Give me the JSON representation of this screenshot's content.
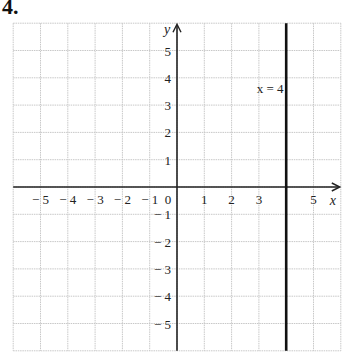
{
  "problem": {
    "number": "4."
  },
  "chart_data": {
    "type": "line",
    "title": "",
    "xlabel": "x",
    "ylabel": "y",
    "xlim": [
      -6,
      6
    ],
    "ylim": [
      -6,
      6
    ],
    "grid": true,
    "x_ticks": [
      -5,
      -4,
      -3,
      -2,
      -1,
      0,
      1,
      2,
      3,
      5
    ],
    "x_tick_labels": [
      "− 5",
      "− 4",
      "− 3",
      "− 2",
      "− 1",
      "0",
      "1",
      "2",
      "3",
      "5"
    ],
    "y_ticks": [
      5,
      4,
      3,
      2,
      1,
      -1,
      -2,
      -3,
      -4,
      -5
    ],
    "y_tick_labels": [
      "5",
      "4",
      "3",
      "2",
      "1",
      "− 1",
      "− 2",
      "− 3",
      "− 4",
      "− 5"
    ],
    "series": [
      {
        "name": "x = 4",
        "kind": "vertical-line",
        "x": [
          4,
          4
        ],
        "y": [
          -6,
          6
        ],
        "color": "#111111"
      }
    ],
    "annotations": [
      {
        "text": "x = 4",
        "x": 3.3,
        "y": 3.6
      }
    ],
    "colors": {
      "grid": "#c8c8c8",
      "axis": "#222222",
      "line": "#111111"
    }
  }
}
